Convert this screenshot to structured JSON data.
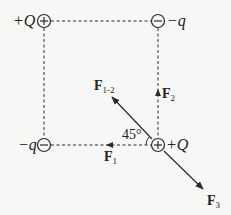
{
  "charges": [
    {
      "id": "top-left",
      "sign": "+",
      "label": "+Q",
      "cx": 44,
      "cy": 21
    },
    {
      "id": "top-right",
      "sign": "-",
      "label": "−q",
      "cx": 158,
      "cy": 21
    },
    {
      "id": "bottom-left",
      "sign": "-",
      "label": "−q",
      "cx": 44,
      "cy": 145
    },
    {
      "id": "bottom-right",
      "sign": "+",
      "label": "+Q",
      "cx": 158,
      "cy": 145
    }
  ],
  "forces": {
    "f1": {
      "symbol": "F",
      "sub": "1",
      "direction": "left"
    },
    "f2": {
      "symbol": "F",
      "sub": "2",
      "direction": "up"
    },
    "f12": {
      "symbol": "F",
      "sub": "1-2",
      "direction": "up-left"
    },
    "f3": {
      "symbol": "F",
      "sub": "3",
      "direction": "down-right"
    }
  },
  "angle_label": "45°",
  "colors": {
    "line": "#2a2a2a",
    "background": "#f7f7f5"
  }
}
